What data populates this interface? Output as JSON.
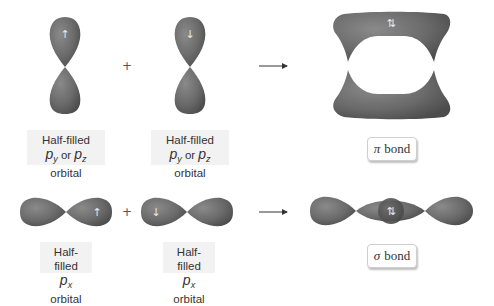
{
  "colors": {
    "orbital_light": "#858585",
    "orbital_mid": "#6a6a6a",
    "orbital_dark": "#4e4e4e",
    "label_bg": "#f2f2f2",
    "text": "#333333"
  },
  "rows": [
    {
      "name": "pi-bond-formation",
      "operator": "+",
      "orbitals": [
        {
          "label_line1": "Half-filled",
          "p1": "p",
          "p1_sub": "y",
          "mid": " or ",
          "p2": "p",
          "p2_sub": "z",
          "suffix": " orbital",
          "spin": "↑",
          "orientation": "vertical"
        },
        {
          "label_line1": "Half-filled",
          "p1": "p",
          "p1_sub": "y",
          "mid": " or ",
          "p2": "p",
          "p2_sub": "z",
          "suffix": " orbital",
          "spin": "↓",
          "orientation": "vertical"
        }
      ],
      "result": {
        "symbol": "π",
        "text": "bond",
        "spin": "⇅"
      }
    },
    {
      "name": "sigma-bond-formation",
      "operator": "+",
      "orbitals": [
        {
          "label_line1": "Half-filled",
          "p1": "p",
          "p1_sub": "x",
          "suffix": " orbital",
          "spin": "↑",
          "orientation": "horizontal"
        },
        {
          "label_line1": "Half-filled",
          "p1": "p",
          "p1_sub": "x",
          "suffix": " orbital",
          "spin": "↓",
          "orientation": "horizontal"
        }
      ],
      "result": {
        "symbol": "σ",
        "text": "bond",
        "spin": "⇅"
      }
    }
  ]
}
